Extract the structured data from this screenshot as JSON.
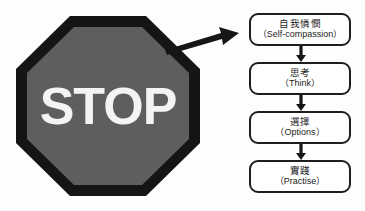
{
  "figure": {
    "background_color": "#fdfdfd",
    "sign": {
      "name": "stop-sign",
      "label": "STOP",
      "fill_color": "#5e5e5e",
      "border_color": "#151515",
      "text_color": "#f4f4f4",
      "shape": "octagon"
    },
    "pointer": {
      "name": "pointer-arrow",
      "direction": "right",
      "color": "#161616"
    },
    "flowchart": {
      "orientation": "vertical",
      "box_border_color": "#1e1e1e",
      "box_fill_color": "#ffffff",
      "connector_color": "#161616",
      "steps": [
        {
          "cn": "自我憐憫",
          "en": "（Self-compassion）"
        },
        {
          "cn": "思考",
          "en": "（Think）"
        },
        {
          "cn": "選擇",
          "en": "（Options）"
        },
        {
          "cn": "實踐",
          "en": "（Practise）"
        }
      ]
    }
  }
}
